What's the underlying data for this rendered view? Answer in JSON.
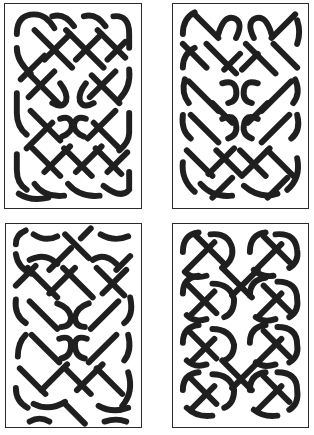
{
  "figure": {
    "ink_color": "#1f1f1f",
    "background_color": "#ffffff",
    "panels": [
      {
        "id": "top-left",
        "label": "Panel A",
        "pattern": "plait with two central returns"
      },
      {
        "id": "top-right",
        "label": "Panel B",
        "pattern": "plait with two rows of central loops"
      },
      {
        "id": "bottom-left",
        "label": "Panel C",
        "pattern": "open-ended plait with central returns"
      },
      {
        "id": "bottom-right",
        "label": "Panel D",
        "pattern": "chain of closed loops"
      }
    ]
  }
}
